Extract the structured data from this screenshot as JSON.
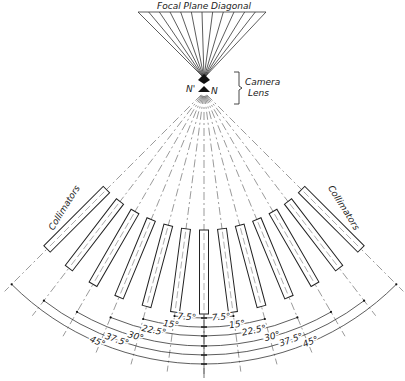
{
  "title": "Focal Plane Diagonal",
  "lens": {
    "label_line1": "Camera",
    "label_line2": "Lens",
    "node_rear": "N'",
    "node_front": "N"
  },
  "collimators_label_left": "Collimators",
  "collimators_label_right": "Collimators",
  "geometry": {
    "focal_plane_y": 12,
    "focal_plane_x0": 138,
    "focal_plane_x1": 266,
    "rear_node": [
      204,
      80
    ],
    "front_node": [
      204,
      92
    ],
    "angle_step_deg": 7.5,
    "max_angle_deg": 45,
    "collimator_inner_r": 138,
    "collimator_outer_r": 222,
    "collimator_width": 9,
    "ray_length": 282,
    "arc_radii": [
      226,
      235,
      244,
      254,
      263,
      272
    ]
  },
  "angle_labels": {
    "left": [
      "7.5°",
      "15°",
      "22.5°",
      "30°",
      "37.5°",
      "45°"
    ],
    "right": [
      "7.5°",
      "15°",
      "22.5°",
      "30°",
      "37.5°",
      "45°"
    ]
  },
  "colors": {
    "line": "#333333",
    "background": "#ffffff"
  }
}
